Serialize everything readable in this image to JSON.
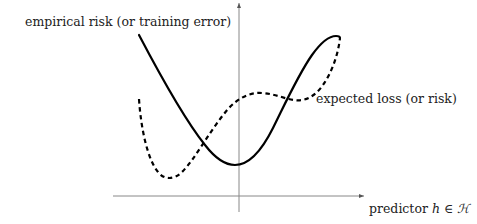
{
  "labels": {
    "empirical_risk": "empirical risk (or training error)",
    "expected_loss": "expected loss (or risk)",
    "x_axis_prefix": "predictor ",
    "x_axis_var": "h",
    "x_axis_in": " ∈ ",
    "x_axis_set": "ℋ"
  },
  "axes": {
    "color": "#808080",
    "x_axis": {
      "from": [
        113,
        196
      ],
      "to": [
        364,
        196
      ],
      "arrow": true
    },
    "y_axis": {
      "from": [
        239,
        212
      ],
      "to": [
        239,
        3
      ],
      "arrow": true
    }
  },
  "curves": [
    {
      "name": "empirical risk",
      "style": "solid",
      "color": "#000000"
    },
    {
      "name": "expected loss",
      "style": "dashed",
      "color": "#000000"
    }
  ]
}
